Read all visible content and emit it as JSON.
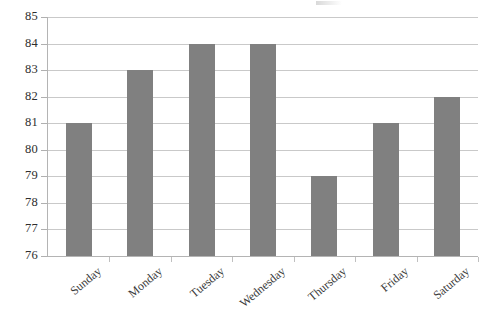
{
  "chart_data": {
    "type": "bar",
    "title": "",
    "xlabel": "",
    "ylabel": "",
    "categories": [
      "Sunday",
      "Monday",
      "Tuesday",
      "Wednesday",
      "Thursday",
      "Friday",
      "Saturday"
    ],
    "values": [
      81,
      83,
      84,
      84,
      79,
      81,
      82
    ],
    "ylim": [
      76,
      85
    ],
    "ytick_labels": [
      "85",
      "84",
      "83",
      "82",
      "81",
      "80",
      "79",
      "78",
      "77",
      "76"
    ],
    "ytick_values": [
      85,
      84,
      83,
      82,
      81,
      80,
      79,
      78,
      77,
      76
    ],
    "grid": true,
    "legend": false,
    "series": [
      {
        "name": "",
        "values": [
          81,
          83,
          84,
          84,
          79,
          81,
          82
        ],
        "color": "#808080"
      }
    ],
    "bar_color": "#808080",
    "gridline_color": "#c9c9c9",
    "axis_color": "#b4b4b4",
    "label_rotation_degrees": -40
  }
}
